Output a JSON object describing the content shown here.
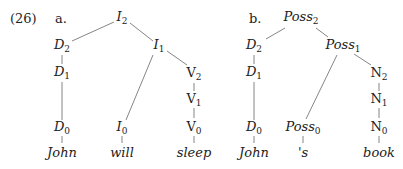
{
  "example_number": "(26)",
  "trees": [
    {
      "label": "a.",
      "nodes": [
        {
          "id": "I2",
          "cat": "I",
          "sub": "2",
          "italic": true
        },
        {
          "id": "D2",
          "cat": "D",
          "sub": "2",
          "italic": true
        },
        {
          "id": "I1",
          "cat": "I",
          "sub": "1",
          "italic": true
        },
        {
          "id": "D1",
          "cat": "D",
          "sub": "1",
          "italic": true
        },
        {
          "id": "V2",
          "cat": "V",
          "sub": "2",
          "italic": false
        },
        {
          "id": "V1",
          "cat": "V",
          "sub": "1",
          "italic": false
        },
        {
          "id": "D0",
          "cat": "D",
          "sub": "0",
          "italic": true
        },
        {
          "id": "I0",
          "cat": "I",
          "sub": "0",
          "italic": true
        },
        {
          "id": "V0",
          "cat": "V",
          "sub": "0",
          "italic": false
        }
      ],
      "leaves": [
        "John",
        "will",
        "sleep"
      ],
      "edges": [
        [
          "I2",
          "D2"
        ],
        [
          "I2",
          "I1"
        ],
        [
          "D2",
          "D1"
        ],
        [
          "D1",
          "D0"
        ],
        [
          "I1",
          "I0"
        ],
        [
          "I1",
          "V2"
        ],
        [
          "V2",
          "V1"
        ],
        [
          "V1",
          "V0"
        ],
        [
          "D0",
          "John"
        ],
        [
          "I0",
          "will"
        ],
        [
          "V0",
          "sleep"
        ]
      ]
    },
    {
      "label": "b.",
      "nodes": [
        {
          "id": "Poss2",
          "cat": "Poss",
          "sub": "2",
          "italic": true
        },
        {
          "id": "D2",
          "cat": "D",
          "sub": "2",
          "italic": true
        },
        {
          "id": "Poss1",
          "cat": "Poss",
          "sub": "1",
          "italic": true
        },
        {
          "id": "D1",
          "cat": "D",
          "sub": "1",
          "italic": true
        },
        {
          "id": "N2",
          "cat": "N",
          "sub": "2",
          "italic": false
        },
        {
          "id": "N1",
          "cat": "N",
          "sub": "1",
          "italic": false
        },
        {
          "id": "D0",
          "cat": "D",
          "sub": "0",
          "italic": true
        },
        {
          "id": "Poss0",
          "cat": "Poss",
          "sub": "0",
          "italic": true
        },
        {
          "id": "N0",
          "cat": "N",
          "sub": "0",
          "italic": false
        }
      ],
      "leaves": [
        "John",
        "'s",
        "book"
      ],
      "edges": [
        [
          "Poss2",
          "D2"
        ],
        [
          "Poss2",
          "Poss1"
        ],
        [
          "D2",
          "D1"
        ],
        [
          "D1",
          "D0"
        ],
        [
          "Poss1",
          "Poss0"
        ],
        [
          "Poss1",
          "N2"
        ],
        [
          "N2",
          "N1"
        ],
        [
          "N1",
          "N0"
        ],
        [
          "D0",
          "John"
        ],
        [
          "Poss0",
          "'s"
        ],
        [
          "N0",
          "book"
        ]
      ]
    }
  ]
}
